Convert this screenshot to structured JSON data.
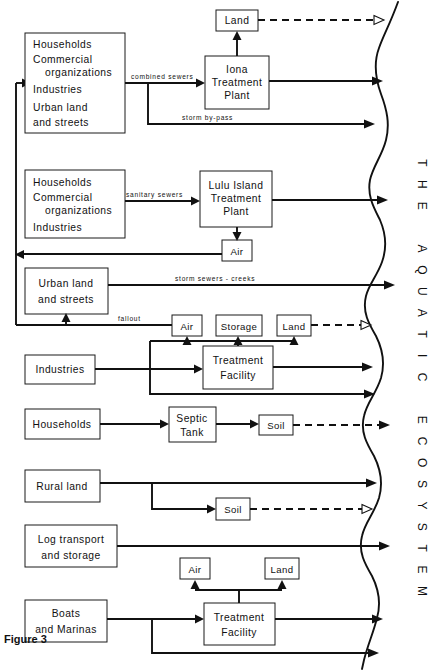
{
  "figure": {
    "caption": "Figure 3",
    "ecosystem_label": "THE AQUATIC ECOSYSTEM"
  },
  "boxes": {
    "src_combined": "Households\nCommercial\n   organizations\nIndustries\nUrban land\nand streets",
    "src_combined_lines": [
      "Households",
      "Commercial",
      "organizations",
      "Industries",
      "Urban land",
      "and streets"
    ],
    "iona_lines": [
      "Iona",
      "Treatment",
      "Plant"
    ],
    "land_top": "Land",
    "src_sanitary_lines": [
      "Households",
      "Commercial",
      "organizations",
      "Industries"
    ],
    "lulu_lines": [
      "Lulu Island",
      "Treatment",
      "Plant"
    ],
    "air_lulu": "Air",
    "urban_lines": [
      "Urban land",
      "and streets"
    ],
    "air_fallout": "Air",
    "storage": "Storage",
    "land_ind": "Land",
    "industries": "Industries",
    "treatment_facility_ind_lines": [
      "Treatment",
      "Facility"
    ],
    "households": "Households",
    "septic_lines": [
      "Septic",
      "Tank"
    ],
    "soil_septic": "Soil",
    "rural_land": "Rural land",
    "soil_rural": "Soil",
    "log_lines": [
      "Log transport",
      "and storage"
    ],
    "air_boats": "Air",
    "land_boats": "Land",
    "boats_lines": [
      "Boats",
      "and  Marinas"
    ],
    "treatment_facility_boats_lines": [
      "Treatment",
      "Facility"
    ]
  },
  "edge_labels": {
    "combined_sewers": "combined  sewers",
    "storm_bypass": "storm  by-pass",
    "sanitary_sewers": "sanitary  sewers",
    "storm_sewers_creeks": "storm  sewers  -  creeks",
    "fallout": "fallout"
  },
  "colors": {
    "line": "#111111",
    "box_stroke": "#1a1a1a",
    "background": "#ffffff"
  }
}
